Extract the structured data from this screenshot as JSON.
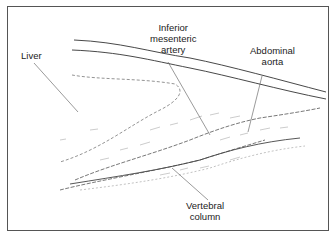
{
  "diagram": {
    "labels": {
      "liver": "Liver",
      "ima_line1": "Inferior",
      "ima_line2": "mesenteric",
      "ima_line3": "artery",
      "aorta_line1": "Abdominal",
      "aorta_line2": "aorta",
      "vertebral_line1": "Vertebral",
      "vertebral_line2": "column"
    }
  }
}
